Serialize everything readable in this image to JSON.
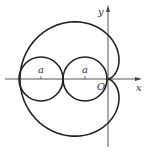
{
  "diagram": {
    "type": "cardioid",
    "equation": "r = 2a(1 - cos θ)",
    "labels": {
      "x_axis": "x",
      "y_axis": "y",
      "origin": "O",
      "circle_left": "a",
      "circle_right": "a"
    },
    "geometry": {
      "origin_px": [
        108,
        79
      ],
      "a_px": 22,
      "circle_centers_px": [
        [
          41,
          79
        ],
        [
          85,
          79
        ]
      ],
      "circle_radius_px": 22
    },
    "colors": {
      "stroke": "#222222",
      "background": "#ffffff"
    }
  }
}
